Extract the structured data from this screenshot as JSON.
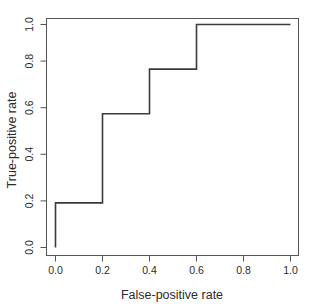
{
  "chart_data": {
    "type": "line",
    "title": "",
    "subtitle": "",
    "xlabel": "False-positive rate",
    "ylabel": "True-positive rate",
    "xlim": [
      0.0,
      1.0
    ],
    "ylim": [
      0.0,
      1.0
    ],
    "grid": false,
    "legend": false,
    "legend_position": "none",
    "line_style": "step-post",
    "series": [
      {
        "name": "ROC curve",
        "color": "#3b3b3b",
        "x": [
          0.0,
          0.0,
          0.2,
          0.2,
          0.4,
          0.4,
          0.6,
          0.6,
          1.0
        ],
        "y": [
          0.0,
          0.2,
          0.2,
          0.6,
          0.6,
          0.8,
          0.8,
          1.0,
          1.0
        ]
      }
    ],
    "xticks": [
      {
        "value": 0.0,
        "label": "0.0"
      },
      {
        "value": 0.2,
        "label": "0.2"
      },
      {
        "value": 0.4,
        "label": "0.4"
      },
      {
        "value": 0.6,
        "label": "0.6"
      },
      {
        "value": 0.8,
        "label": "0.8"
      },
      {
        "value": 1.0,
        "label": "1.0"
      }
    ],
    "yticks": [
      {
        "value": 0.0,
        "label": "0.0"
      },
      {
        "value": 0.2,
        "label": "0.2"
      },
      {
        "value": 0.4,
        "label": "0.4"
      },
      {
        "value": 0.6,
        "label": "0.6"
      },
      {
        "value": 0.8,
        "label": "0.8"
      },
      {
        "value": 1.0,
        "label": "1.0"
      }
    ]
  },
  "axes": {
    "x_title": "False-positive rate",
    "y_title": "True-positive rate",
    "x_tick_labels": [
      "0.0",
      "0.2",
      "0.4",
      "0.6",
      "0.8",
      "1.0"
    ],
    "y_tick_labels": [
      "0.0",
      "0.2",
      "0.4",
      "0.6",
      "0.8",
      "1.0"
    ]
  },
  "colors": {
    "background": "#ffffff",
    "line": "#3b3b3b",
    "axis": "#555555",
    "text": "#2b2b2b"
  }
}
